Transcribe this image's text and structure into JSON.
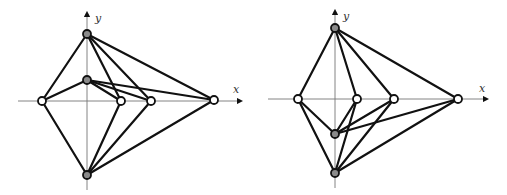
{
  "figures": [
    {
      "id": "left",
      "axes": {
        "origin": [
          87,
          101
        ],
        "x_axis": {
          "from": 18,
          "to": 240,
          "label": "x",
          "label_pos": [
            233,
            93
          ]
        },
        "y_axis": {
          "from": 190,
          "to": 14,
          "label": "y",
          "label_pos": [
            95,
            22
          ]
        }
      },
      "nodes": [
        {
          "name": "top",
          "x": 87,
          "y": 34,
          "style": "filled"
        },
        {
          "name": "mid",
          "x": 87,
          "y": 80,
          "style": "filled"
        },
        {
          "name": "left",
          "x": 42,
          "y": 101,
          "style": "open"
        },
        {
          "name": "inner1",
          "x": 121,
          "y": 101,
          "style": "open"
        },
        {
          "name": "inner2",
          "x": 151,
          "y": 101,
          "style": "open"
        },
        {
          "name": "far",
          "x": 214,
          "y": 100,
          "style": "open"
        },
        {
          "name": "bottom",
          "x": 87,
          "y": 175,
          "style": "filled"
        }
      ],
      "edges": [
        [
          "top",
          "left"
        ],
        [
          "top",
          "inner1"
        ],
        [
          "top",
          "inner2"
        ],
        [
          "top",
          "far"
        ],
        [
          "mid",
          "left"
        ],
        [
          "mid",
          "inner1"
        ],
        [
          "mid",
          "inner2"
        ],
        [
          "mid",
          "far"
        ],
        [
          "bottom",
          "left"
        ],
        [
          "bottom",
          "inner1"
        ],
        [
          "bottom",
          "inner2"
        ],
        [
          "bottom",
          "far"
        ]
      ]
    },
    {
      "id": "right",
      "axes": {
        "origin": [
          335,
          99
        ],
        "x_axis": {
          "from": 268,
          "to": 486,
          "label": "x",
          "label_pos": [
            479,
            92
          ]
        },
        "y_axis": {
          "from": 188,
          "to": 12,
          "label": "y",
          "label_pos": [
            343,
            20
          ]
        }
      },
      "nodes": [
        {
          "name": "top",
          "x": 335,
          "y": 28,
          "style": "filled"
        },
        {
          "name": "left",
          "x": 298,
          "y": 99,
          "style": "open"
        },
        {
          "name": "inner1",
          "x": 357,
          "y": 99,
          "style": "open"
        },
        {
          "name": "inner2",
          "x": 394,
          "y": 99,
          "style": "open"
        },
        {
          "name": "far",
          "x": 458,
          "y": 99,
          "style": "open"
        },
        {
          "name": "lowmid",
          "x": 335,
          "y": 134,
          "style": "filled"
        },
        {
          "name": "bottom",
          "x": 335,
          "y": 173,
          "style": "filled"
        }
      ],
      "edges": [
        [
          "top",
          "left"
        ],
        [
          "top",
          "inner1"
        ],
        [
          "top",
          "inner2"
        ],
        [
          "top",
          "far"
        ],
        [
          "lowmid",
          "left"
        ],
        [
          "lowmid",
          "inner1"
        ],
        [
          "lowmid",
          "inner2"
        ],
        [
          "lowmid",
          "far"
        ],
        [
          "bottom",
          "left"
        ],
        [
          "bottom",
          "inner1"
        ],
        [
          "bottom",
          "inner2"
        ],
        [
          "bottom",
          "far"
        ]
      ]
    }
  ],
  "labels": {
    "x": "x",
    "y": "y"
  },
  "node_radius": 4
}
